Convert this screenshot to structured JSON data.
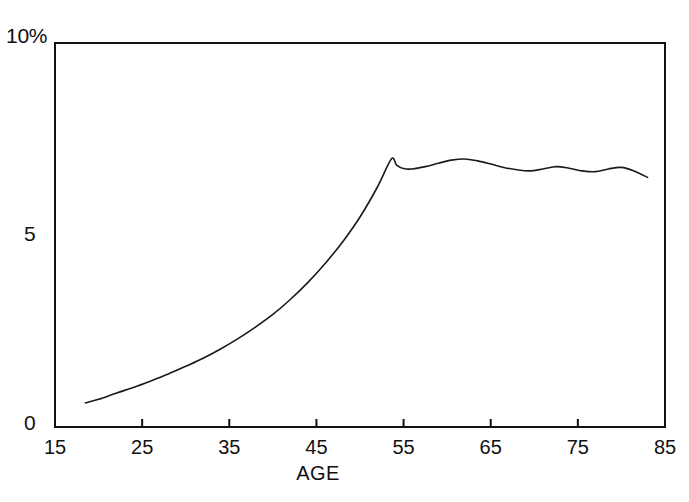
{
  "chart_data": {
    "type": "line",
    "title": "",
    "subtitle": "",
    "xlabel": "AGE",
    "ylabel": "",
    "y_axis_unit": "%",
    "xlim": [
      15,
      85
    ],
    "ylim": [
      0,
      10
    ],
    "grid": false,
    "legend": false,
    "legend_position": "none",
    "x_ticks": [
      15,
      25,
      35,
      45,
      55,
      65,
      75,
      85
    ],
    "x_tick_labels": [
      "15",
      "25",
      "35",
      "45",
      "55",
      "65",
      "75",
      "85"
    ],
    "y_ticks": [
      0,
      5,
      10
    ],
    "y_tick_labels": [
      "0",
      "5",
      "10%"
    ],
    "line_color": "#1a1a1a",
    "line_width": 1.6,
    "axis_color": "#111111",
    "background_color": "#ffffff",
    "series": [
      {
        "name": "prevalence",
        "x": [
          18.5,
          20,
          22,
          24,
          26,
          28,
          30,
          32,
          34,
          36,
          38,
          40,
          42,
          44,
          46,
          48,
          50,
          52,
          53.6,
          54.2,
          55,
          56,
          57.5,
          59,
          60.5,
          62,
          63.5,
          65,
          66.5,
          68,
          69.5,
          71,
          72.5,
          74,
          75.5,
          77,
          78.5,
          80,
          81.5,
          83
        ],
        "y": [
          0.63,
          0.72,
          0.88,
          1.03,
          1.2,
          1.38,
          1.58,
          1.79,
          2.03,
          2.3,
          2.6,
          2.93,
          3.32,
          3.76,
          4.26,
          4.82,
          5.47,
          6.25,
          6.98,
          6.82,
          6.73,
          6.72,
          6.78,
          6.87,
          6.95,
          6.98,
          6.93,
          6.85,
          6.76,
          6.7,
          6.67,
          6.72,
          6.78,
          6.74,
          6.67,
          6.65,
          6.72,
          6.76,
          6.66,
          6.5
        ]
      }
    ],
    "annotations": []
  },
  "axis": {
    "y_top_label": "10%",
    "y_mid_label": "5",
    "y_zero_label": "0",
    "x_title": "AGE"
  }
}
